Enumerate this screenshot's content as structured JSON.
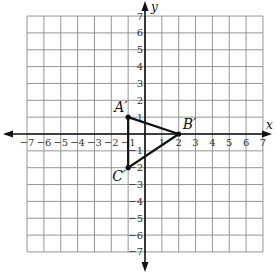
{
  "axes": {
    "x_label": "x",
    "y_label": "y",
    "x_range": [
      -7,
      7
    ],
    "y_range": [
      -7,
      7
    ],
    "x_ticks": [
      "−7",
      "−6",
      "−5",
      "−4",
      "−3",
      "−2",
      "−1",
      "1",
      "2",
      "3",
      "4",
      "5",
      "6",
      "7"
    ],
    "y_ticks": [
      "7",
      "6",
      "5",
      "4",
      "3",
      "2",
      "1",
      "−1",
      "−2",
      "−3",
      "−4",
      "−5",
      "−6",
      "−7"
    ]
  },
  "triangle": {
    "vertices": [
      {
        "name": "A′",
        "x": -1,
        "y": 1
      },
      {
        "name": "B′",
        "x": 2,
        "y": 0
      },
      {
        "name": "C′",
        "x": -1,
        "y": -2
      }
    ]
  },
  "colors": {
    "grid": "#8a8a8a",
    "axis": "#111111",
    "shape": "#111111"
  }
}
